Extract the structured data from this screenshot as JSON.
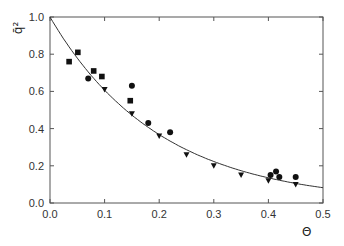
{
  "chart_data": {
    "type": "scatter",
    "title": "",
    "xlabel": "Θ",
    "ylabel": "q̄²",
    "xlim": [
      0.0,
      0.5
    ],
    "ylim": [
      0.0,
      1.0
    ],
    "x_ticks": [
      "0.0",
      "0.1",
      "0.2",
      "0.3",
      "0.4",
      "0.5"
    ],
    "y_ticks": [
      "0.0",
      "0.2",
      "0.4",
      "0.6",
      "0.8",
      "1.0"
    ],
    "grid": false,
    "legend": null,
    "series": [
      {
        "name": "squares",
        "marker": "square",
        "points": [
          [
            0.035,
            0.76
          ],
          [
            0.051,
            0.81
          ],
          [
            0.08,
            0.71
          ],
          [
            0.095,
            0.68
          ],
          [
            0.147,
            0.55
          ]
        ]
      },
      {
        "name": "circles",
        "marker": "circle",
        "points": [
          [
            0.07,
            0.67
          ],
          [
            0.15,
            0.63
          ],
          [
            0.18,
            0.43
          ],
          [
            0.22,
            0.38
          ],
          [
            0.404,
            0.15
          ],
          [
            0.414,
            0.17
          ],
          [
            0.42,
            0.14
          ],
          [
            0.45,
            0.14
          ]
        ]
      },
      {
        "name": "triangles",
        "marker": "triangle-down",
        "points": [
          [
            0.1,
            0.61
          ],
          [
            0.15,
            0.48
          ],
          [
            0.2,
            0.36
          ],
          [
            0.25,
            0.26
          ],
          [
            0.3,
            0.2
          ],
          [
            0.35,
            0.15
          ],
          [
            0.4,
            0.12
          ],
          [
            0.45,
            0.1
          ]
        ]
      },
      {
        "name": "fit",
        "marker": "line",
        "function": "exp(-5Θ)",
        "x": [
          0.0,
          0.05,
          0.1,
          0.15,
          0.2,
          0.25,
          0.3,
          0.35,
          0.4,
          0.45,
          0.5
        ],
        "values": [
          1.0,
          0.78,
          0.61,
          0.47,
          0.37,
          0.29,
          0.22,
          0.17,
          0.14,
          0.11,
          0.08
        ]
      }
    ]
  },
  "colors": {
    "axis": "#555555",
    "marker": "#111111",
    "line": "#333333"
  }
}
